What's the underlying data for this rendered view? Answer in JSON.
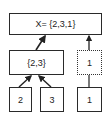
{
  "diagram": {
    "root": {
      "label": "X= {2,3,1}"
    },
    "middle": [
      {
        "label": "{2,3}",
        "style": "solid"
      },
      {
        "label": "1",
        "style": "dotted"
      }
    ],
    "leaves": [
      {
        "label": "2"
      },
      {
        "label": "3"
      },
      {
        "label": "1"
      }
    ],
    "edges": [
      {
        "from": "{2,3}",
        "to": "X= {2,3,1}",
        "arrow": true
      },
      {
        "from": "1 (dotted)",
        "to": "X= {2,3,1}",
        "arrow": true
      },
      {
        "from": "2",
        "to": "{2,3}",
        "arrow": true
      },
      {
        "from": "3",
        "to": "{2,3}",
        "arrow": true
      },
      {
        "from": "1 (leaf)",
        "to": "1 (dotted)",
        "arrow": false
      }
    ],
    "colors": {
      "stroke": "#2a2a2a",
      "background": "#ffffff"
    }
  }
}
